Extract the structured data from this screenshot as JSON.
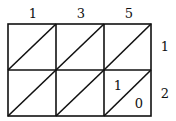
{
  "diagram": {
    "type": "lattice-multiplication",
    "top_digits": [
      "1",
      "3",
      "5"
    ],
    "right_digits": [
      "1",
      "2"
    ],
    "cells": [
      [
        {
          "tens": "",
          "ones": ""
        },
        {
          "tens": "",
          "ones": ""
        },
        {
          "tens": "",
          "ones": ""
        }
      ],
      [
        {
          "tens": "",
          "ones": ""
        },
        {
          "tens": "",
          "ones": ""
        },
        {
          "tens": "1",
          "ones": "0"
        }
      ]
    ],
    "stroke_color": "#111111"
  }
}
